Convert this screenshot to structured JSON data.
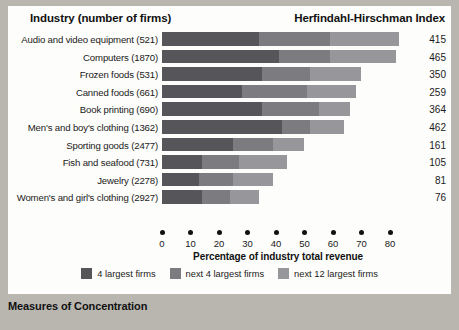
{
  "caption": "Measures of Concentration",
  "header": {
    "industry_title": "Industry (number of firms)",
    "hhi_title": "Herfindahl-Hirschman Index"
  },
  "legend": [
    {
      "label": "4 largest firms",
      "color": "#55555a",
      "name": "legend-4-largest"
    },
    {
      "label": "next 4 largest firms",
      "color": "#7b7b80",
      "name": "legend-next-4-largest"
    },
    {
      "label": "next 12 largest firms",
      "color": "#96969b",
      "name": "legend-next-12-largest"
    }
  ],
  "chart_data": {
    "type": "bar",
    "orientation": "horizontal",
    "stacked": true,
    "title": "Measures of Concentration",
    "xlabel": "Percentage of industry total revenue",
    "ylabel": "Industry (number of firms)",
    "xlim": [
      0,
      80
    ],
    "xticks": [
      0,
      10,
      20,
      30,
      40,
      50,
      60,
      70,
      80
    ],
    "grid": false,
    "legend_position": "bottom",
    "series": [
      {
        "name": "4 largest firms",
        "color": "#55555a",
        "values": [
          34,
          41,
          35,
          28,
          35,
          42,
          25,
          14,
          13,
          14
        ]
      },
      {
        "name": "next 4 largest firms",
        "color": "#7b7b80",
        "values": [
          25,
          18,
          17,
          23,
          20,
          10,
          14,
          13,
          12,
          10
        ]
      },
      {
        "name": "next 12 largest firms",
        "color": "#96969b",
        "values": [
          24,
          23,
          18,
          17,
          11,
          12,
          11,
          17,
          14,
          10
        ]
      }
    ],
    "categories": [
      "Audio and video equipment  (521)",
      "Computers  (1870)",
      "Frozen foods  (531)",
      "Canned foods  (661)",
      "Book printing  (690)",
      "Men's and boy's clothing  (1362)",
      "Sporting goods  (2477)",
      "Fish and seafood  (731)",
      "Jewelry  (2278)",
      "Women's and girl's clothing  (2927)"
    ],
    "annotation_column": {
      "label": "Herfindahl-Hirschman Index",
      "values": [
        415,
        465,
        350,
        259,
        364,
        462,
        161,
        105,
        81,
        76
      ]
    }
  }
}
